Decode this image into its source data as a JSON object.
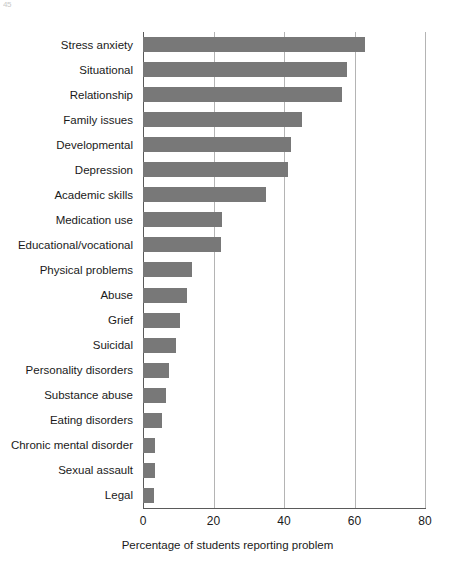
{
  "page": {
    "artifact_text": "45"
  },
  "chart_data": {
    "type": "bar",
    "orientation": "horizontal",
    "title": "",
    "xlabel": "Percentage of students reporting problem",
    "ylabel": "",
    "xlim": [
      0,
      80
    ],
    "xticks": [
      0,
      20,
      40,
      60,
      80
    ],
    "xtick_labels": [
      "0",
      "20",
      "40",
      "60",
      "80"
    ],
    "grid": "vertical",
    "legend": "none",
    "bar_color": "#787878",
    "axis_color": "#5a5a5a",
    "grid_color": "#b4b4b4",
    "categories": [
      "Stress anxiety",
      "Situational",
      "Relationship",
      "Family issues",
      "Developmental",
      "Depression",
      "Academic skills",
      "Medication use",
      "Educational/vocational",
      "Physical problems",
      "Abuse",
      "Grief",
      "Suicidal",
      "Personality disorders",
      "Substance abuse",
      "Eating disorders",
      "Chronic mental disorder",
      "Sexual assault",
      "Legal"
    ],
    "values": [
      63,
      58,
      56.5,
      45,
      42,
      41,
      35,
      22.5,
      22,
      14,
      12.5,
      10.5,
      9.5,
      7.5,
      6.5,
      5.5,
      3.5,
      3.5,
      3
    ]
  }
}
